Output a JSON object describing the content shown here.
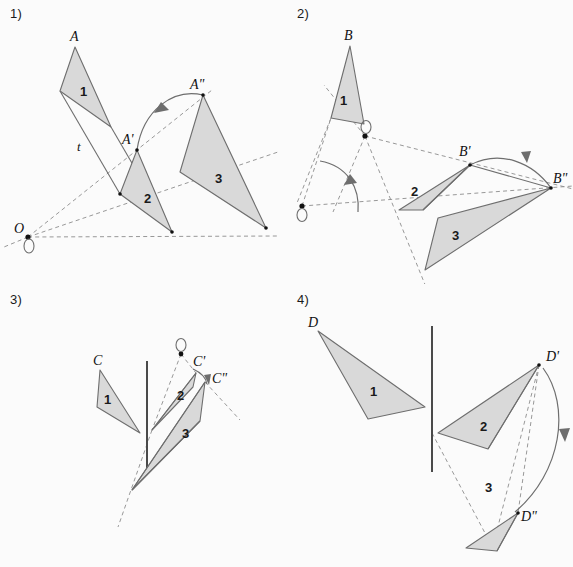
{
  "figure": {
    "background": "#fbfbfb",
    "triangle_fill": "#d9d9d9",
    "triangle_stroke": "#6e6e6e",
    "dashed_stroke": "#8c8c8c",
    "mirror_stroke": "#4a4a4a"
  },
  "panels": [
    {
      "id": "panel-1",
      "label": "1)",
      "transformation": "two successive rotations about centre O",
      "center_label": "O",
      "translation_label": "t",
      "triangles": [
        {
          "number": "1",
          "apex_label": "A",
          "points": "75,47 60,91 111,127",
          "num_x": 82,
          "num_y": 91,
          "label_x": 70,
          "label_y": 41
        },
        {
          "number": "2",
          "apex_label": "A'",
          "points": "137,150 120,194 172,232",
          "num_x": 147,
          "num_y": 198,
          "label_x": 124,
          "label_y": 144
        },
        {
          "number": "3",
          "apex_label": "A\"",
          "points": "203,95 180,172 266,228",
          "num_x": 216,
          "num_y": 178,
          "label_x": 193,
          "label_y": 89
        }
      ],
      "centre_point": {
        "x": 28,
        "y": 237
      },
      "rays": [
        "28,237 212,90",
        "28,237 272,150",
        "28,237 278,236"
      ],
      "translation_lines": [
        "60,91 120,194",
        "111,127 172,232"
      ],
      "t_label": {
        "x": 80,
        "y": 148
      },
      "arc": {
        "path": "M 137,150 C 140,108 172,88 203,95"
      }
    },
    {
      "id": "panel-2",
      "label": "2)",
      "transformation": "two successive rotations about two different centres",
      "triangles": [
        {
          "number": "1",
          "apex_label": "B",
          "points": "350,46 331,118 364,124",
          "num_x": 342,
          "num_y": 103,
          "label_x": 344,
          "label_y": 40
        },
        {
          "number": "2",
          "apex_label": "B'",
          "points": "470,165 399,210 423,210",
          "num_x": 414,
          "num_y": 194,
          "label_x": 462,
          "label_y": 155
        },
        {
          "number": "3",
          "apex_label": "B\"",
          "points": "551,188 438,218 425,270",
          "num_x": 455,
          "num_y": 236,
          "label_x": 555,
          "label_y": 182
        }
      ],
      "centres": [
        {
          "x": 365,
          "y": 136
        },
        {
          "x": 302,
          "y": 206
        }
      ],
      "dashed_lines": [
        "365,136 334,77",
        "365,136 326,89",
        "365,136 573,189",
        "365,136 333,212",
        "302,206 332,123",
        "302,206 573,186",
        "331,118 297,203",
        "364,124 425,285",
        "302,206 427,283"
      ],
      "angle_arc": {
        "path": "M 320,161 C 346,164 358,186 358,212"
      },
      "arc": {
        "path": "M 470,165 C 500,150 532,166 551,188"
      }
    },
    {
      "id": "panel-3",
      "label": "3)",
      "transformation": "reflection in a line then rotation about a centre",
      "triangles": [
        {
          "number": "1",
          "apex_label": "C",
          "points": "100,370 97,407 140,433",
          "num_x": 107,
          "num_y": 400,
          "label_x": 95,
          "label_y": 364
        },
        {
          "number": "2",
          "apex_label": "C'",
          "points": "196,373 193,387 152,430",
          "num_x": 179,
          "num_y": 401,
          "label_x": 193,
          "label_y": 367
        },
        {
          "number": "3",
          "apex_label": "C\"",
          "points": "205,382 200,420 132,490",
          "num_x": 186,
          "num_y": 434,
          "label_x": 212,
          "label_y": 381
        }
      ],
      "mirror_line": "147,362 147,470",
      "centre_point": {
        "x": 181,
        "y": 354
      },
      "dashed_lines": [
        "181,354 152,430",
        "181,354 196,373",
        "152,430 132,527",
        "205,382 237,418"
      ],
      "solid_links": [
        "152,430 196,373",
        "132,490 205,382"
      ],
      "arc": {
        "path": "M 194,371 C 202,377 205,380 206,383"
      }
    },
    {
      "id": "panel-4",
      "label": "4)",
      "transformation": "reflection in a line then rotation",
      "triangles": [
        {
          "number": "1",
          "apex_label": "D",
          "points": "318,331 368,419 425,407",
          "num_x": 373,
          "num_y": 391,
          "label_x": 310,
          "label_y": 326
        },
        {
          "number": "2",
          "apex_label": "D'",
          "points": "539,365 438,433 488,449",
          "num_x": 483,
          "num_y": 426,
          "label_x": 548,
          "label_y": 360
        },
        {
          "number": "3",
          "apex_label": "D\"",
          "points": "518,513 466,548 497,551",
          "num_x": 488,
          "num_y": 487,
          "label_x": 523,
          "label_y": 517
        }
      ],
      "mirror_line": "432,326 432,472",
      "dashed_lines": [
        "432,433 494,550",
        "539,365 494,550",
        "539,365 518,513"
      ],
      "arc": {
        "path": "M 542,368 C 569,405 560,470 514,512"
      }
    }
  ]
}
